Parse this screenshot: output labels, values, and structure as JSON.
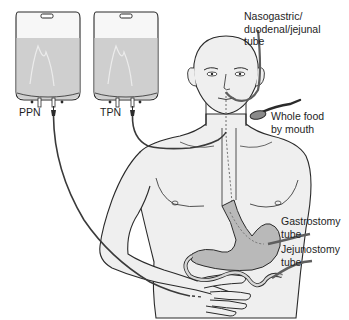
{
  "figure": {
    "type": "medical-illustration",
    "colors": {
      "line": "#2a2a2a",
      "skin": "#efefef",
      "bag_fluid": "#cfcfcf",
      "bag_empty": "#f7f7f7",
      "stomach": "#b9b9b9",
      "tube": "#6a6a6a",
      "background": "#ffffff"
    }
  },
  "labels": {
    "ppn": "PPN",
    "tpn": "TPN",
    "nasogastric": "Nasogastric/\nduodenal/jejunal\ntube",
    "whole_food": "Whole food\nby mouth",
    "gastrostomy": "Gastrostomy\ntube",
    "jejunostomy": "Jejunostomy\ntube"
  }
}
